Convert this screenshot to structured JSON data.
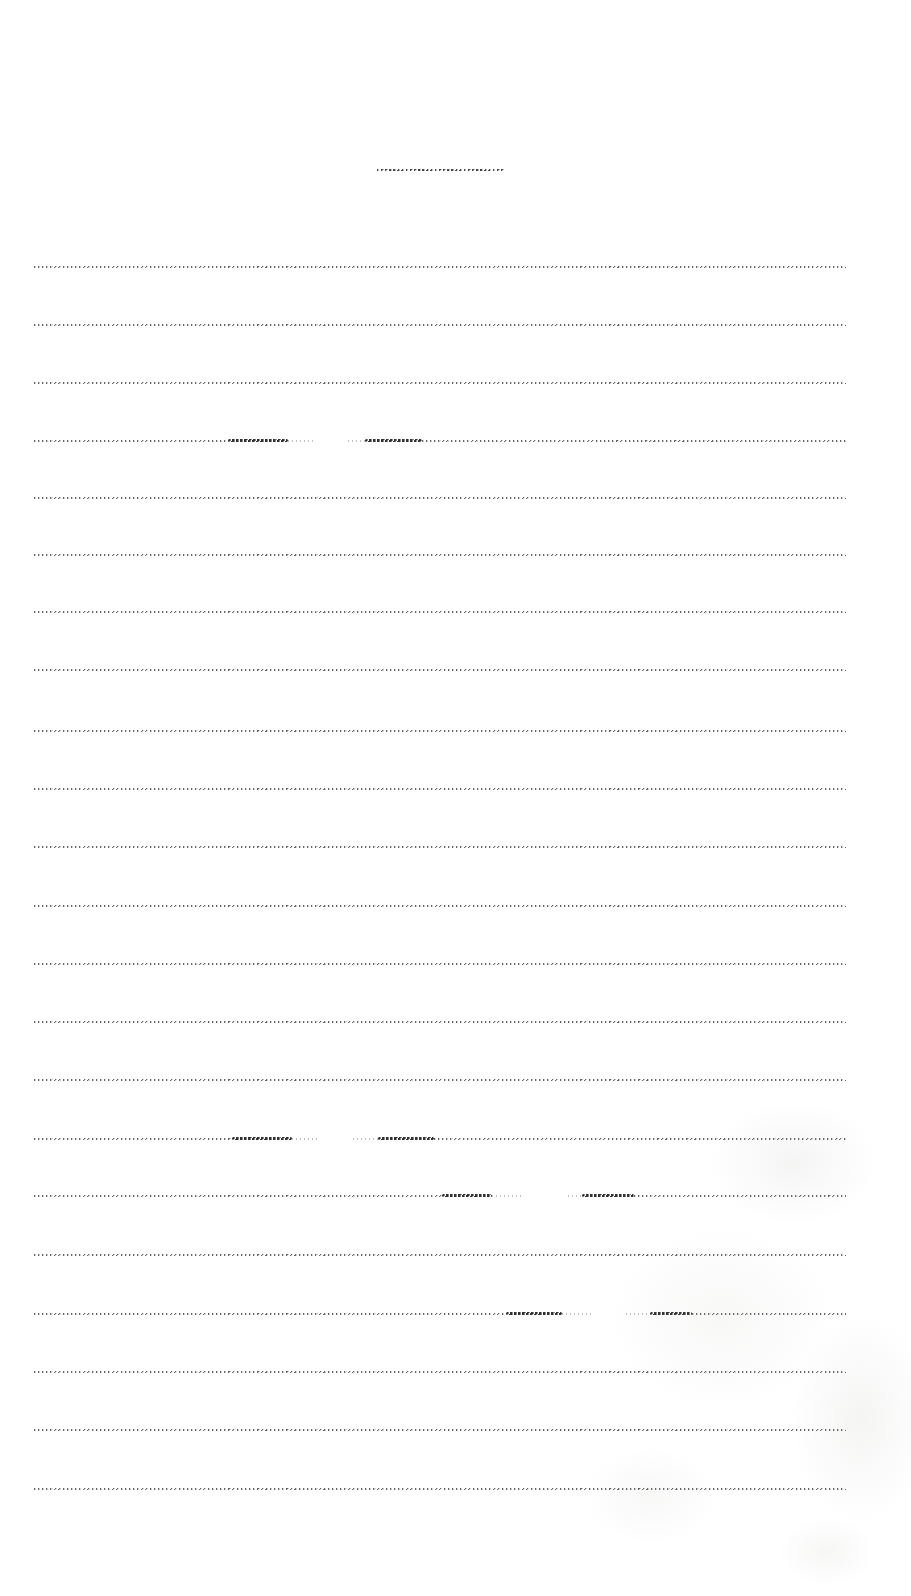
{
  "canvas": {
    "width": 911,
    "height": 1596,
    "background": "#ffffff"
  },
  "title_rule": {
    "x": 377,
    "y": 169,
    "width": 127,
    "thickness": 2,
    "color": "#4a4a4a"
  },
  "ruled_lines": {
    "x": 34,
    "width": 812,
    "thickness": 2,
    "color": "#6e6e6e",
    "ys": [
      266,
      324,
      382,
      440,
      497,
      554,
      611,
      669,
      730,
      788,
      846,
      905,
      963,
      1021,
      1079,
      1138,
      1195,
      1254,
      1313,
      1371,
      1429,
      1488
    ]
  },
  "line_variations": [
    {
      "line_index": 3,
      "segments": [
        {
          "x": 34,
          "w": 194,
          "style": "normal"
        },
        {
          "x": 228,
          "w": 60,
          "style": "dark"
        },
        {
          "x": 288,
          "w": 27,
          "style": "fade"
        },
        {
          "x": 315,
          "w": 33,
          "style": "gap"
        },
        {
          "x": 348,
          "w": 17,
          "style": "fade"
        },
        {
          "x": 365,
          "w": 57,
          "style": "dark"
        },
        {
          "x": 422,
          "w": 424,
          "style": "normal"
        }
      ]
    },
    {
      "line_index": 15,
      "segments": [
        {
          "x": 34,
          "w": 198,
          "style": "normal"
        },
        {
          "x": 232,
          "w": 60,
          "style": "dark"
        },
        {
          "x": 292,
          "w": 28,
          "style": "fade"
        },
        {
          "x": 320,
          "w": 33,
          "style": "gap"
        },
        {
          "x": 353,
          "w": 25,
          "style": "fade"
        },
        {
          "x": 378,
          "w": 56,
          "style": "dark"
        },
        {
          "x": 434,
          "w": 412,
          "style": "normal"
        }
      ]
    },
    {
      "line_index": 16,
      "segments": [
        {
          "x": 34,
          "w": 408,
          "style": "normal"
        },
        {
          "x": 442,
          "w": 50,
          "style": "dark"
        },
        {
          "x": 492,
          "w": 32,
          "style": "fade"
        },
        {
          "x": 524,
          "w": 44,
          "style": "gap"
        },
        {
          "x": 568,
          "w": 14,
          "style": "fade"
        },
        {
          "x": 582,
          "w": 52,
          "style": "dark"
        },
        {
          "x": 634,
          "w": 212,
          "style": "normal"
        }
      ]
    },
    {
      "line_index": 18,
      "segments": [
        {
          "x": 34,
          "w": 472,
          "style": "normal"
        },
        {
          "x": 506,
          "w": 56,
          "style": "dark"
        },
        {
          "x": 562,
          "w": 30,
          "style": "fade"
        },
        {
          "x": 592,
          "w": 34,
          "style": "gap"
        },
        {
          "x": 626,
          "w": 24,
          "style": "fade"
        },
        {
          "x": 650,
          "w": 42,
          "style": "dark"
        },
        {
          "x": 692,
          "w": 154,
          "style": "normal"
        }
      ]
    }
  ]
}
